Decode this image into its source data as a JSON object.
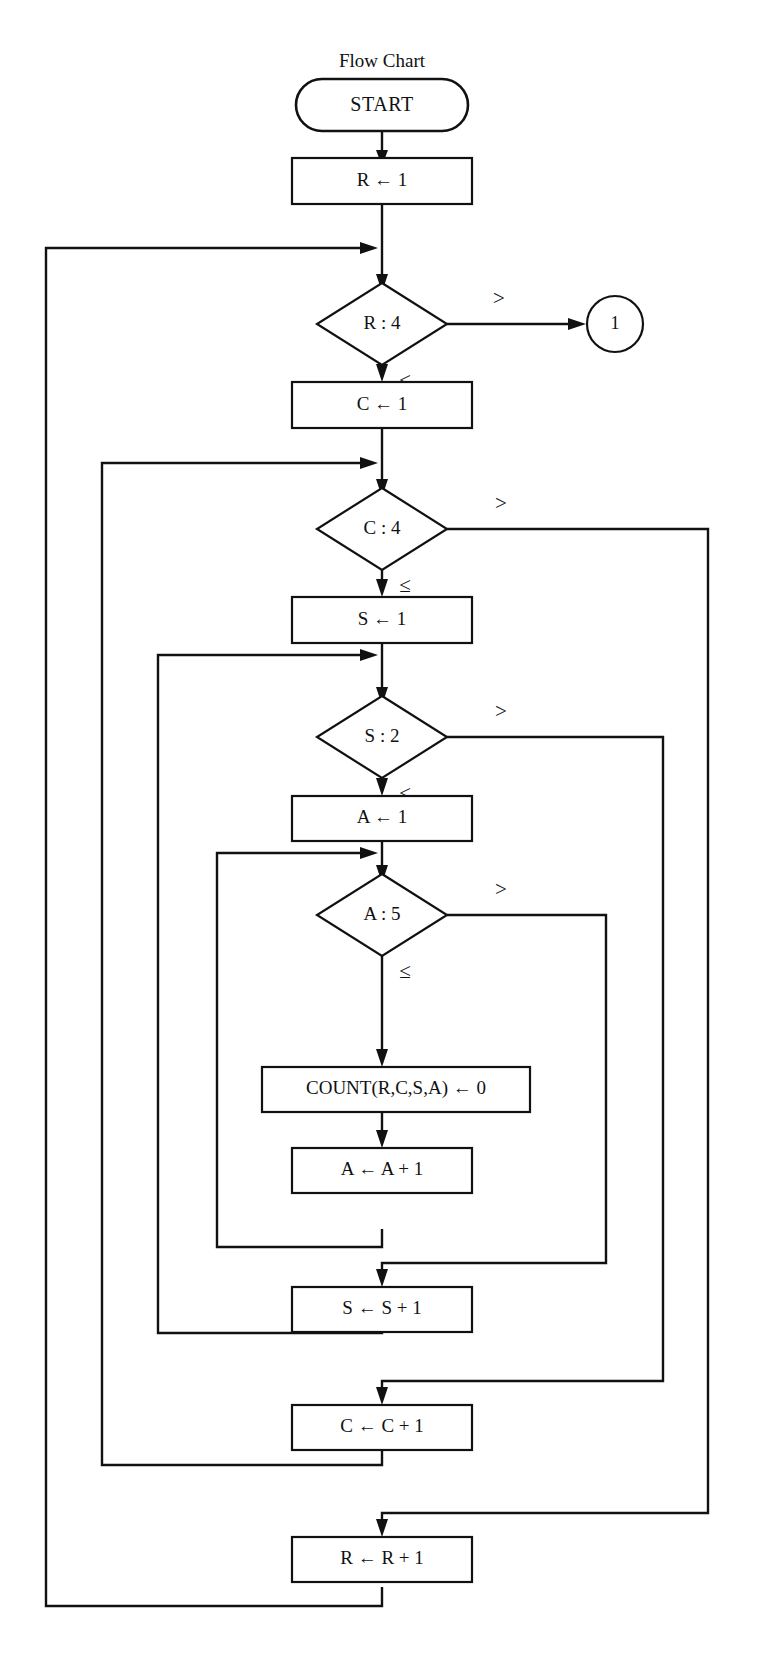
{
  "title": "Flow Chart",
  "diagram": {
    "type": "flowchart",
    "nodes": [
      {
        "id": "start",
        "kind": "terminator",
        "label": "START"
      },
      {
        "id": "init_r",
        "kind": "process",
        "label": "R ← 1"
      },
      {
        "id": "test_r",
        "kind": "decision",
        "label": "R : 4"
      },
      {
        "id": "conn_1",
        "kind": "connector",
        "label": "1"
      },
      {
        "id": "init_c",
        "kind": "process",
        "label": "C ← 1"
      },
      {
        "id": "test_c",
        "kind": "decision",
        "label": "C : 4"
      },
      {
        "id": "init_s",
        "kind": "process",
        "label": "S ← 1"
      },
      {
        "id": "test_s",
        "kind": "decision",
        "label": "S : 2"
      },
      {
        "id": "init_a",
        "kind": "process",
        "label": "A ← 1"
      },
      {
        "id": "test_a",
        "kind": "decision",
        "label": "A : 5"
      },
      {
        "id": "count_zero",
        "kind": "process",
        "label": "COUNT(R,C,S,A) ← 0"
      },
      {
        "id": "inc_a",
        "kind": "process",
        "label": "A ← A + 1"
      },
      {
        "id": "inc_s",
        "kind": "process",
        "label": "S ← S + 1"
      },
      {
        "id": "inc_c",
        "kind": "process",
        "label": "C ← C + 1"
      },
      {
        "id": "inc_r",
        "kind": "process",
        "label": "R ← R + 1"
      }
    ],
    "branch_labels": {
      "greater": ">",
      "less_equal": "≤"
    },
    "edges": [
      {
        "from": "test_r",
        "to": "conn_1",
        "label": ">"
      },
      {
        "from": "test_r",
        "to": "init_c",
        "label": "≤"
      },
      {
        "from": "test_c",
        "to": "inc_r",
        "label": ">"
      },
      {
        "from": "test_c",
        "to": "init_s",
        "label": "≤"
      },
      {
        "from": "test_s",
        "to": "inc_c",
        "label": ">"
      },
      {
        "from": "test_s",
        "to": "init_a",
        "label": "≤"
      },
      {
        "from": "test_a",
        "to": "inc_s",
        "label": ">"
      },
      {
        "from": "test_a",
        "to": "count_zero",
        "label": "≤"
      },
      {
        "from": "inc_a",
        "to": "test_a",
        "label": ""
      },
      {
        "from": "inc_s",
        "to": "test_s",
        "label": ""
      },
      {
        "from": "inc_c",
        "to": "test_c",
        "label": ""
      },
      {
        "from": "inc_r",
        "to": "test_r",
        "label": ""
      }
    ]
  },
  "labels": {
    "start": "START",
    "init_r": "R ← 1",
    "test_r": "R : 4",
    "conn_1": "1",
    "init_c": "C ← 1",
    "test_c": "C : 4",
    "init_s": "S ← 1",
    "test_s": "S : 2",
    "init_a": "A ← 1",
    "test_a": "A : 5",
    "count_zero": "COUNT(R,C,S,A) ← 0",
    "inc_a": "A ← A + 1",
    "inc_s": "S ← S + 1",
    "inc_c": "C ← C + 1",
    "inc_r": "R ← R + 1",
    "gt_r": ">",
    "le_r": "≤",
    "gt_c": ">",
    "le_c": "≤",
    "gt_s": ">",
    "le_s": "≤",
    "gt_a": ">",
    "le_a": "≤"
  },
  "colors": {
    "ink": "#111111",
    "paper": "#ffffff"
  }
}
